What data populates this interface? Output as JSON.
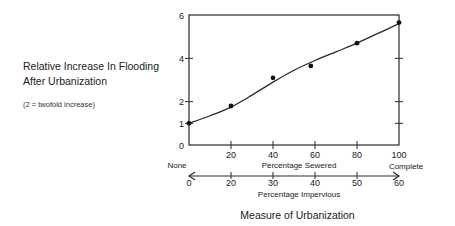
{
  "chart_data": {
    "type": "line",
    "title": "",
    "ylabel": "Relative Increase In Flooding After Urbanization",
    "ylabel_lines": [
      "Relative Increase In Flooding",
      "After Urbanization"
    ],
    "ylabel_note": "(2 = twofold increase)",
    "xlabel": "Measure of Urbanization",
    "ylim": [
      0,
      6
    ],
    "yticks": [
      0,
      1,
      2,
      4,
      6
    ],
    "right_yticks": [
      1,
      2,
      4
    ],
    "x_axes": [
      {
        "label": "Percentage Sewered",
        "range": [
          0,
          100
        ],
        "ticks": [
          0,
          20,
          40,
          60,
          80,
          100
        ],
        "tick_labels": [
          "",
          "20",
          "40",
          "60",
          "80",
          "100"
        ],
        "start_label": "None",
        "end_label": "Complete"
      },
      {
        "label": "Percentage Impervious",
        "tick_labels": [
          "0",
          "20",
          "30",
          "40",
          "50",
          "60"
        ]
      }
    ],
    "series": [
      {
        "name": "Observed",
        "style": "points",
        "x": [
          0,
          20,
          40,
          58,
          80,
          100
        ],
        "y": [
          1.0,
          1.8,
          3.1,
          3.65,
          4.7,
          5.65
        ]
      },
      {
        "name": "Fitted curve",
        "style": "line",
        "x": [
          0,
          10,
          20,
          30,
          40,
          50,
          60,
          70,
          80,
          90,
          100
        ],
        "y": [
          1.0,
          1.35,
          1.75,
          2.3,
          2.9,
          3.45,
          3.9,
          4.3,
          4.7,
          5.15,
          5.6
        ]
      }
    ],
    "grid": false,
    "legend": "none"
  }
}
